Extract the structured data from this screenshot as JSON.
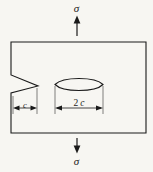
{
  "figure": {
    "caption_visible": false,
    "background_color": "#f7f6f2",
    "stroke_color": "#1a1a1a",
    "labels": {
      "stress_top": "σ",
      "stress_bottom": "σ",
      "dim_edge_crack": "c",
      "dim_internal_crack_number": "2",
      "dim_internal_crack_symbol": "c"
    },
    "icons": {
      "load_arrow_up": "arrow-up-icon",
      "load_arrow_down": "arrow-down-icon",
      "dimension_arrow_left": "arrow-left-icon",
      "dimension_arrow_right": "arrow-right-icon"
    },
    "geometry": {
      "plate": {
        "x": 11,
        "y": 42,
        "width": 135,
        "height": 91
      },
      "edge_notch": {
        "opening_top_y": 75,
        "tip_x": 38,
        "tip_y": 86,
        "opening_bottom_y": 93
      },
      "internal_crack": {
        "left_x": 55,
        "right_x": 103,
        "top_y": 77,
        "bottom_y": 92
      },
      "dimension_line_y": 108,
      "arrow_top": {
        "x": 77,
        "y_start": 36,
        "y_end": 17
      },
      "arrow_bottom": {
        "x": 77,
        "y_start": 138,
        "y_end": 153
      }
    }
  }
}
